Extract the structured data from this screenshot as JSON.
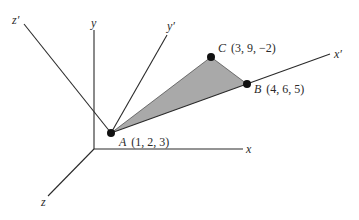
{
  "figure": {
    "axes": {
      "x": "x",
      "y": "y",
      "z": "z",
      "x_prime": "x′",
      "y_prime": "y′",
      "z_prime": "z′"
    },
    "points": {
      "A": {
        "name": "A",
        "coords": "(1, 2, 3)"
      },
      "B": {
        "name": "B",
        "coords": "(4, 6, 5)"
      },
      "C": {
        "name": "C",
        "coords": "(3, 9, −2)"
      }
    },
    "colors": {
      "line": "#2a2a2a",
      "triangle_fill": "#a9a9a9",
      "point": "#111111"
    }
  }
}
